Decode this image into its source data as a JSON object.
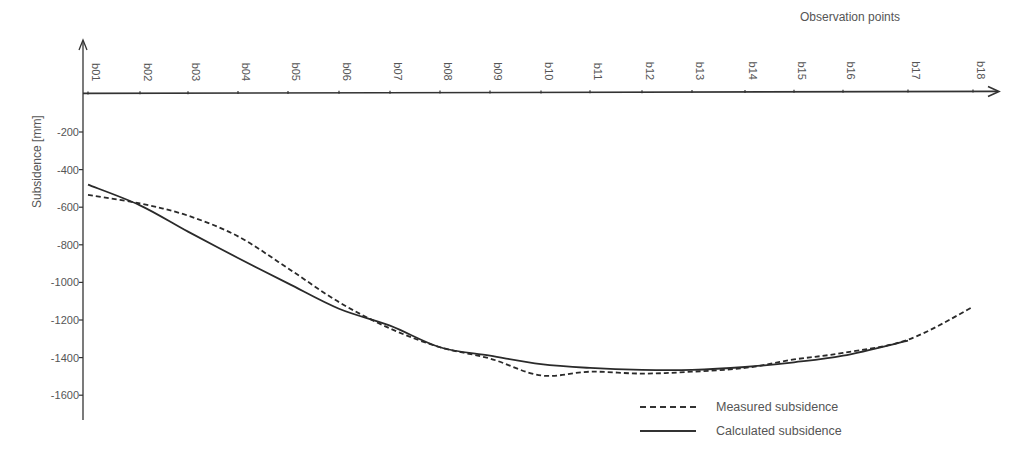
{
  "chart_data": {
    "type": "line",
    "title": "",
    "xlabel": "Observation points",
    "ylabel": "Subsidence [mm]",
    "categories": [
      "b01",
      "b02",
      "b03",
      "b04",
      "b05",
      "b06",
      "b07",
      "b08",
      "b09",
      "b10",
      "b11",
      "b12",
      "b13",
      "b14",
      "b15",
      "b16",
      "b17",
      "b18"
    ],
    "x_positions_px": [
      88,
      140,
      188,
      238,
      288,
      339,
      390,
      440,
      490,
      541,
      590,
      642,
      692,
      745,
      794,
      843,
      908,
      973
    ],
    "yticks": [
      -200,
      -400,
      -600,
      -800,
      -1000,
      -1200,
      -1400,
      -1600
    ],
    "ylim": [
      -1700,
      0
    ],
    "grid": false,
    "legend_position": "bottom-right",
    "series": [
      {
        "name": "Measured subsidence",
        "style": "dashed",
        "values": [
          -535,
          -580,
          -645,
          -755,
          -925,
          -1105,
          -1245,
          -1345,
          -1405,
          -1495,
          -1475,
          -1485,
          -1475,
          -1455,
          -1410,
          -1375,
          -1305,
          -1130
        ]
      },
      {
        "name": "Calculated subsidence",
        "style": "solid",
        "values": [
          -480,
          -590,
          -730,
          -870,
          -1005,
          -1140,
          -1230,
          -1345,
          -1390,
          -1435,
          -1455,
          -1465,
          -1465,
          -1450,
          -1425,
          -1390,
          -1310,
          null
        ]
      }
    ]
  },
  "legend": {
    "measured_label": "Measured subsidence",
    "calculated_label": "Calculated subsidence"
  }
}
